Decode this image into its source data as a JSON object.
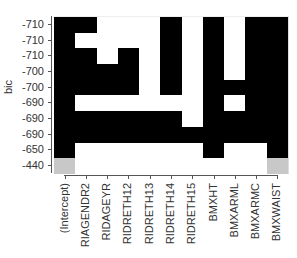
{
  "chart_data": {
    "type": "heatmap",
    "title": "",
    "xlabel": "",
    "ylabel": "bic",
    "columns": [
      "(Intercept)",
      "RIAGENDR2",
      "RIDAGEYR",
      "RIDRETH12",
      "RIDRETH13",
      "RIDRETH14",
      "RIDRETH15",
      "BMXHT",
      "BMXARML",
      "BMXARMC",
      "BMXWAIST"
    ],
    "rows": [
      "-710",
      "-710",
      "-710",
      "-700",
      "-700",
      "-690",
      "-690",
      "-690",
      "-650",
      "-440"
    ],
    "legend": {
      "0": "excluded (white)",
      "1": "included (black)",
      "2": "included (gray, null model)"
    },
    "matrix": [
      [
        1,
        1,
        0,
        0,
        0,
        1,
        0,
        1,
        0,
        1,
        1
      ],
      [
        1,
        0,
        0,
        0,
        0,
        1,
        0,
        1,
        0,
        1,
        1
      ],
      [
        1,
        1,
        0,
        1,
        0,
        1,
        0,
        1,
        0,
        1,
        1
      ],
      [
        1,
        1,
        1,
        1,
        0,
        1,
        0,
        1,
        0,
        1,
        1
      ],
      [
        1,
        1,
        1,
        1,
        0,
        1,
        0,
        1,
        1,
        1,
        1
      ],
      [
        1,
        0,
        0,
        0,
        0,
        0,
        0,
        1,
        0,
        1,
        1
      ],
      [
        1,
        1,
        1,
        1,
        1,
        1,
        0,
        1,
        1,
        1,
        1
      ],
      [
        1,
        1,
        1,
        1,
        1,
        1,
        1,
        1,
        1,
        1,
        1
      ],
      [
        1,
        0,
        0,
        0,
        0,
        0,
        0,
        1,
        0,
        0,
        1
      ],
      [
        2,
        0,
        0,
        0,
        0,
        0,
        0,
        0,
        0,
        0,
        2
      ]
    ],
    "colors": {
      "included": "#000000",
      "excluded": "#ffffff",
      "null_model": "#c8c8c8"
    }
  }
}
